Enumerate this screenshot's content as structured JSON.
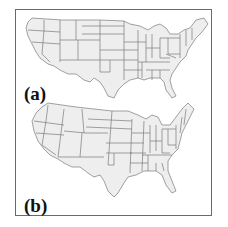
{
  "figure": {
    "panels": [
      {
        "id": "a",
        "label": "(a)",
        "description": "Contiguous United States state boundaries map (projection a)"
      },
      {
        "id": "b",
        "label": "(b)",
        "description": "Contiguous United States state boundaries map (projection b)"
      }
    ],
    "colors": {
      "land_fill": "#eeeeee",
      "state_border": "#7a7a7a",
      "frame_border": "#6a6a6a",
      "label_text": "#111111"
    }
  }
}
